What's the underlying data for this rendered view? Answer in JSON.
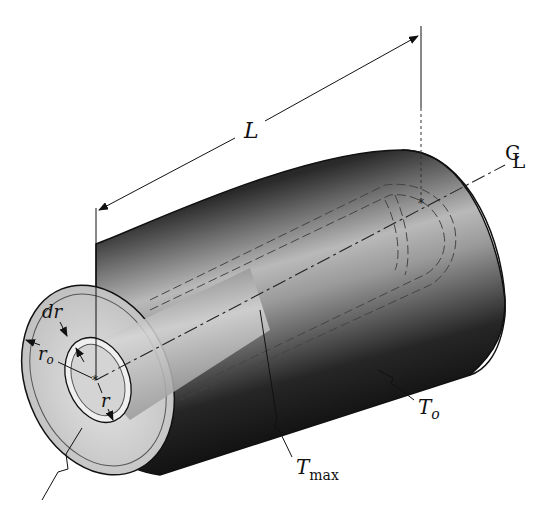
{
  "figure": {
    "labels": {
      "length": "L",
      "centerline": "CL",
      "centerline_c": "C",
      "centerline_l": "L",
      "shell_thickness": "dr",
      "outer_radius_main": "r",
      "outer_radius_sub": "o",
      "inner_radius": "r",
      "max_temp_main": "T",
      "max_temp_sub": "max",
      "surface_temp_main": "T",
      "surface_temp_sub": "o"
    },
    "colors": {
      "background": "#ffffff",
      "cylinder_dark": "#111111",
      "cylinder_mid": "#6e6e6e",
      "cylinder_light": "#d9d9d9",
      "end_face": "#c8c8c8",
      "line": "#1a1a1a"
    }
  }
}
